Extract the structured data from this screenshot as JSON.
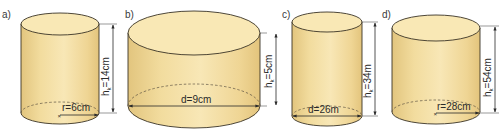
{
  "colors": {
    "body_light": "#f7e6b2",
    "body_mid": "#efd693",
    "body_dark": "#e0c27a",
    "top_face": "#f9e8b5",
    "outline": "#3a3326",
    "dim_line": "#2a2a2a"
  },
  "cylinders": [
    {
      "id": "a",
      "label": "a)",
      "height_label": "h",
      "height_sub": "k",
      "height_value": "=14cm",
      "base_label": "r=6cm",
      "base_type": "radius"
    },
    {
      "id": "b",
      "label": "b)",
      "height_label": "h",
      "height_sub": "k",
      "height_value": "=5cm",
      "base_label": "d=9cm",
      "base_type": "diameter"
    },
    {
      "id": "c",
      "label": "c)",
      "height_label": "h",
      "height_sub": "k",
      "height_value": "=34m",
      "base_label": "d=26m",
      "base_type": "diameter"
    },
    {
      "id": "d",
      "label": "d)",
      "height_label": "h",
      "height_sub": "k",
      "height_value": "=54cm",
      "base_label": "r=28cm",
      "base_type": "radius"
    }
  ]
}
